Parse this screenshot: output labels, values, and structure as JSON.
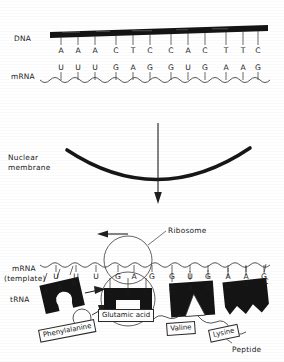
{
  "figure": {
    "background_color": "#ffffff",
    "ink_color": "#1a1a1a"
  },
  "transcription": {
    "dna_label": "DNA",
    "mrna_label": "mRNA",
    "dna_bases": [
      "A",
      "A",
      "A",
      "C",
      "T",
      "C",
      "C",
      "A",
      "C",
      "T",
      "T",
      "C"
    ],
    "mrna_bases": [
      "U",
      "U",
      "U",
      "G",
      "A",
      "G",
      "G",
      "U",
      "G",
      "A",
      "A",
      "G"
    ]
  },
  "nucleus": {
    "membrane_label_line1": "Nuclear",
    "membrane_label_line2": "membrane",
    "arrow_direction": "down"
  },
  "translation": {
    "mrna_label_line1": "mRNA",
    "mrna_label_line2": "(template)",
    "ribosome_label": "Ribosome",
    "trna_label": "tRNA",
    "peptide_label": "Peptide",
    "ribosome_movement": "left",
    "codons": [
      {
        "codon": [
          "U",
          "U",
          "U"
        ],
        "anticodon": [
          "A",
          "A",
          "A"
        ],
        "amino_acid": "Phenylalanine",
        "state": "incoming"
      },
      {
        "codon": [
          "G",
          "A",
          "G"
        ],
        "anticodon": [
          "C",
          "U",
          "C"
        ],
        "amino_acid": "Glutamic acid",
        "state": "in-ribosome"
      },
      {
        "codon": [
          "G",
          "U",
          "G"
        ],
        "anticodon": [
          "C",
          "A",
          "C"
        ],
        "amino_acid": "Valine",
        "state": "attached"
      },
      {
        "codon": [
          "A",
          "A",
          "G"
        ],
        "anticodon": [
          "U",
          "U",
          "C"
        ],
        "amino_acid": "Lysine",
        "state": "attached"
      }
    ]
  }
}
